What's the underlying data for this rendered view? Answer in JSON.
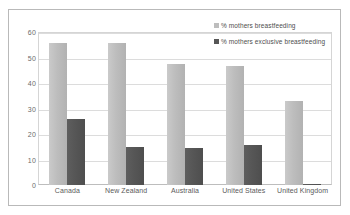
{
  "chart_data": {
    "type": "bar",
    "title": "",
    "xlabel": "",
    "ylabel": "",
    "ylim": [
      0,
      60
    ],
    "yticks": [
      0,
      10,
      20,
      30,
      40,
      50,
      60
    ],
    "grid": true,
    "legend_position": "top-right",
    "categories": [
      "Canada",
      "New Zealand",
      "Australia",
      "United States",
      "United Kingdom"
    ],
    "series": [
      {
        "name": "% mothers breastfeeding",
        "color": "#bdbdbd",
        "values": [
          55.5,
          55.5,
          47.5,
          46.5,
          33
        ]
      },
      {
        "name": "% mothers exclusive breastfeeding",
        "color": "#565656",
        "values": [
          26,
          14.8,
          14.7,
          15.5,
          0.5
        ]
      }
    ]
  }
}
